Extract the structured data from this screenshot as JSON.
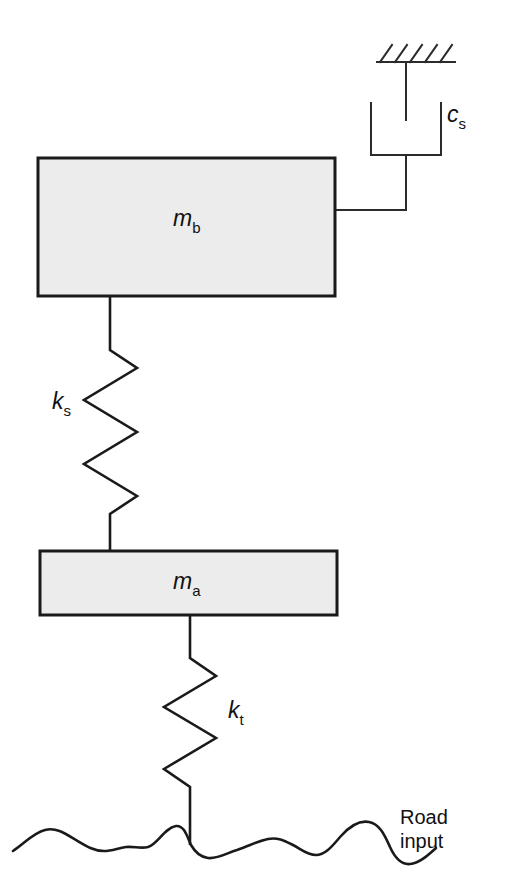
{
  "diagram": {
    "components": {
      "damper": {
        "symbol": "c",
        "subscript": "s",
        "name": "suspension-damper"
      },
      "body_mass": {
        "symbol": "m",
        "subscript": "b",
        "name": "body-mass-block"
      },
      "suspension_spring": {
        "symbol": "k",
        "subscript": "s",
        "name": "suspension-spring"
      },
      "axle_mass": {
        "symbol": "m",
        "subscript": "a",
        "name": "axle-mass-block"
      },
      "tire_spring": {
        "symbol": "k",
        "subscript": "t",
        "name": "tire-spring"
      },
      "road": {
        "label_line1": "Road",
        "label_line2": "input",
        "name": "road-input"
      }
    },
    "colors": {
      "line": "#1a1a1a",
      "block_fill": "#ececec",
      "block_border": "#1a1a1a",
      "text": "#111111",
      "background": "#ffffff"
    }
  }
}
